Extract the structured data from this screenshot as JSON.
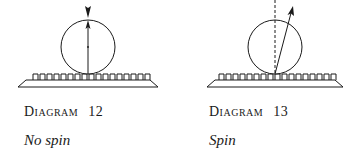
{
  "diagrams": [
    {
      "id": 12,
      "label_word": "Diagram",
      "label_number": "12",
      "subtitle": "No spin",
      "ball": {
        "cx": 88,
        "cy": 47,
        "r": 27
      },
      "arrow": "vertical-up",
      "incoming_arrow": "vertical-down"
    },
    {
      "id": 13,
      "label_word": "Diagram",
      "label_number": "13",
      "subtitle": "Spin",
      "ball": {
        "cx": 275,
        "cy": 47,
        "r": 27
      },
      "arrow": "angled-up-right",
      "reference_line": "dashed-vertical"
    }
  ],
  "colors": {
    "ink": "#1a1a1a",
    "background": "#ffffff"
  }
}
